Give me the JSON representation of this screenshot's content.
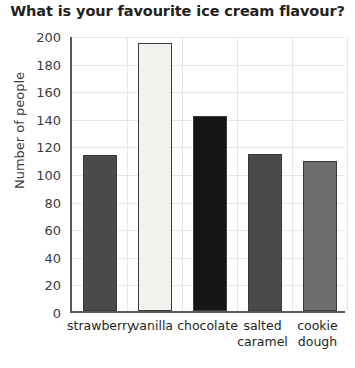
{
  "chart_data": {
    "type": "bar",
    "title": "What is your favourite ice cream flavour?",
    "xlabel": "",
    "ylabel": "Number of people",
    "categories": [
      "strawberry",
      "vanilla",
      "chocolate",
      "salted caramel",
      "cookie dough"
    ],
    "category_lines": [
      [
        "strawberry"
      ],
      [
        "vanilla"
      ],
      [
        "chocolate"
      ],
      [
        "salted",
        "caramel"
      ],
      [
        "cookie",
        "dough"
      ]
    ],
    "values": [
      113,
      194,
      141,
      114,
      109
    ],
    "bar_colors": [
      "#4a4a4a",
      "#f2f2ef",
      "#161616",
      "#4a4a4a",
      "#6e6e6e"
    ],
    "ylim": [
      0,
      200
    ],
    "ytick_step": 20,
    "yticks": [
      0,
      20,
      40,
      60,
      80,
      100,
      120,
      140,
      160,
      180,
      200
    ],
    "ytick_labels": [
      "0",
      "20",
      "40",
      "60",
      "80",
      "100",
      "120",
      "140",
      "160",
      "180",
      "200"
    ],
    "grid": true,
    "legend": false
  }
}
